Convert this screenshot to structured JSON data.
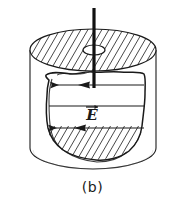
{
  "figure": {
    "caption": "(b)",
    "field_label": "E",
    "field_label_vector_accent": "→",
    "colors": {
      "background": "#ffffff",
      "ink": "#1a1a1a",
      "hatch": "#333333",
      "rod": "#111111"
    },
    "elements": {
      "cylinder_name": "cylinder",
      "top_disk_name": "hatched-top-disk",
      "hole_name": "central-hole",
      "rod_name": "central-rod",
      "loop_name": "amperian-loop",
      "field_lines_name": "electric-field-lines",
      "bottom_hatch_name": "hatched-bottom-region"
    },
    "field_lines": {
      "count": 3,
      "direction": "left",
      "arrow_glyph": "◀"
    },
    "hatching": {
      "angle_deg": 60,
      "spacing_px": 7,
      "top_disk_line_count": 22,
      "bottom_region_line_count": 14
    },
    "geometry": {
      "cylinder_top_ellipse_cx": 93,
      "cylinder_top_ellipse_cy": 50,
      "cylinder_rx": 63,
      "cylinder_ry": 21,
      "cylinder_bottom_cy": 148,
      "hole_cx": 94,
      "hole_cy": 50,
      "hole_rx": 11,
      "hole_ry": 5,
      "rod_x": 94,
      "rod_top_y": 8,
      "rod_bottom_y": 88
    }
  }
}
